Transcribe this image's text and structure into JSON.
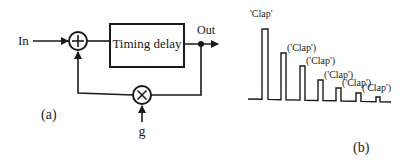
{
  "figure_a": {
    "label": "(a)",
    "input_label": "In",
    "output_label": "Out",
    "gain_label": "g",
    "delay_block": {
      "label": "Timing delay"
    },
    "sum_node": {
      "symbol": "+"
    },
    "multiply_node": {
      "symbol": "×"
    }
  },
  "figure_b": {
    "label": "(b)",
    "pulses": [
      {
        "label": "'Clap'",
        "x": 262,
        "width": 6,
        "top": 29
      },
      {
        "label": "('Clap')",
        "x": 281,
        "width": 5,
        "top": 53
      },
      {
        "label": "('Clap')",
        "x": 300,
        "width": 5,
        "top": 66
      },
      {
        "label": "('Clap')",
        "x": 318,
        "width": 5,
        "top": 80
      },
      {
        "label": "('Clap')",
        "x": 336,
        "width": 5,
        "top": 88
      },
      {
        "label": "('Clap')",
        "x": 356,
        "width": 5,
        "top": 93
      },
      {
        "label": "",
        "x": 376,
        "width": 4,
        "top": 97
      }
    ]
  },
  "colors": {
    "ink": "#1a1a1a",
    "background": "#ffffff"
  }
}
